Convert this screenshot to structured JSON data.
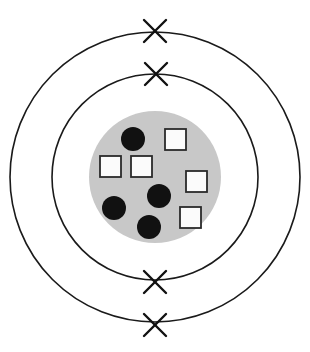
{
  "figure": {
    "type": "bohr-atomic-model-diagram",
    "background_color": "#ffffff",
    "canvas": {
      "width": 310,
      "height": 352
    }
  },
  "colors": {
    "nucleus_fill": "#c8c8c8",
    "proton_fill": "#111111",
    "neutron_fill": "#fbfbfb",
    "neutron_stroke": "#2a2a2a",
    "ring_stroke": "#1a1a1a",
    "electron_stroke": "#111111"
  },
  "nucleus": {
    "label": "nucleus",
    "center": {
      "x": 155,
      "y": 177
    },
    "radius": 66,
    "proton_count": 4,
    "neutron_count": 5
  },
  "protons": [
    {
      "id": "proton-1",
      "cx": 133,
      "cy": 139,
      "r": 12
    },
    {
      "id": "proton-2",
      "cx": 159,
      "cy": 196,
      "r": 12
    },
    {
      "id": "proton-3",
      "cx": 114,
      "cy": 208,
      "r": 12
    },
    {
      "id": "proton-4",
      "cx": 149,
      "cy": 227,
      "r": 12
    }
  ],
  "neutrons": [
    {
      "id": "neutron-1",
      "x": 165,
      "y": 129,
      "size": 21
    },
    {
      "id": "neutron-2",
      "x": 100,
      "y": 156,
      "size": 21
    },
    {
      "id": "neutron-3",
      "x": 131,
      "y": 156,
      "size": 21
    },
    {
      "id": "neutron-4",
      "x": 186,
      "y": 171,
      "size": 21
    },
    {
      "id": "neutron-5",
      "x": 180,
      "y": 207,
      "size": 21
    }
  ],
  "shells": [
    {
      "id": "shell-inner",
      "label": "inner electron shell",
      "cx": 155,
      "cy": 177,
      "r": 103
    },
    {
      "id": "shell-outer",
      "label": "outer electron shell",
      "cx": 155,
      "cy": 177,
      "r": 145
    }
  ],
  "electrons": [
    {
      "id": "electron-outer-top",
      "cx": 155,
      "cy": 31,
      "arm": 11,
      "shell": "shell-outer"
    },
    {
      "id": "electron-inner-top",
      "cx": 156,
      "cy": 74,
      "arm": 11,
      "shell": "shell-inner"
    },
    {
      "id": "electron-inner-bottom",
      "cx": 155,
      "cy": 282,
      "arm": 11,
      "shell": "shell-inner"
    },
    {
      "id": "electron-outer-bottom",
      "cx": 155,
      "cy": 325,
      "arm": 11,
      "shell": "shell-outer"
    }
  ],
  "chart_data": {
    "type": "scatter",
    "xlabel": "",
    "ylabel": "",
    "xlim": [
      0,
      310
    ],
    "ylim": [
      0,
      352
    ],
    "grid": false,
    "legend": null,
    "series": [
      {
        "name": "protons",
        "marker": "filled-circle",
        "color": "#111111",
        "values": [
          {
            "x": 133,
            "y": 139
          },
          {
            "x": 159,
            "y": 196
          },
          {
            "x": 114,
            "y": 208
          },
          {
            "x": 149,
            "y": 227
          }
        ]
      },
      {
        "name": "neutrons",
        "marker": "open-square",
        "color": "#fbfbfb",
        "values": [
          {
            "x": 175,
            "y": 139
          },
          {
            "x": 110,
            "y": 166
          },
          {
            "x": 141,
            "y": 166
          },
          {
            "x": 196,
            "y": 181
          },
          {
            "x": 190,
            "y": 217
          }
        ]
      },
      {
        "name": "electrons",
        "marker": "x-cross",
        "color": "#111111",
        "values": [
          {
            "x": 155,
            "y": 31
          },
          {
            "x": 156,
            "y": 74
          },
          {
            "x": 155,
            "y": 282
          },
          {
            "x": 155,
            "y": 325
          }
        ]
      }
    ],
    "annotations": [
      {
        "kind": "circle",
        "name": "nucleus",
        "cx": 155,
        "cy": 177,
        "r": 66,
        "fill": "#c8c8c8"
      },
      {
        "kind": "circle",
        "name": "inner-shell",
        "cx": 155,
        "cy": 177,
        "r": 103,
        "fill": "none"
      },
      {
        "kind": "circle",
        "name": "outer-shell",
        "cx": 155,
        "cy": 177,
        "r": 145,
        "fill": "none"
      }
    ]
  }
}
